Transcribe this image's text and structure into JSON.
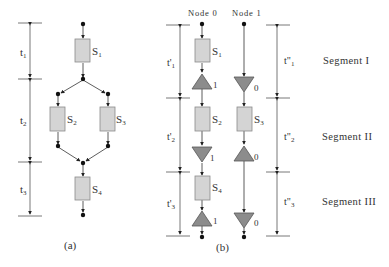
{
  "colors": {
    "box_fill": "#d4d4d4",
    "box_stroke": "#8a8a8a",
    "triangle_fill": "#8c8c8c",
    "triangle_stroke": "#555555",
    "line": "#444444",
    "text": "#333333"
  },
  "panel_a": {
    "caption": "(a)",
    "intervals": [
      {
        "label": "t",
        "sub": "1"
      },
      {
        "label": "t",
        "sub": "2"
      },
      {
        "label": "t",
        "sub": "3"
      }
    ],
    "tasks": [
      {
        "label": "S",
        "sub": "1"
      },
      {
        "label": "S",
        "sub": "2"
      },
      {
        "label": "S",
        "sub": "3"
      },
      {
        "label": "S",
        "sub": "4"
      }
    ]
  },
  "panel_b": {
    "caption": "(b)",
    "nodes": [
      {
        "label": "Node 0"
      },
      {
        "label": "Node 1"
      }
    ],
    "left_intervals": [
      {
        "label": "t'",
        "sub": "1"
      },
      {
        "label": "t'",
        "sub": "2"
      },
      {
        "label": "t'",
        "sub": "3"
      }
    ],
    "right_intervals": [
      {
        "label": "t\"",
        "sub": "1"
      },
      {
        "label": "t\"",
        "sub": "2"
      },
      {
        "label": "t\"",
        "sub": "3"
      }
    ],
    "node0_tasks": [
      {
        "label": "S",
        "sub": "1"
      },
      {
        "label": "S",
        "sub": "2"
      },
      {
        "label": "S",
        "sub": "4"
      }
    ],
    "node1_tasks": [
      {
        "label": "S",
        "sub": "3"
      }
    ],
    "node0_comm": [
      "1",
      "1",
      "1"
    ],
    "node1_comm": [
      "0",
      "0",
      "0"
    ],
    "segments": [
      {
        "label": "Segment I"
      },
      {
        "label": "Segment II"
      },
      {
        "label": "Segment III"
      }
    ]
  }
}
